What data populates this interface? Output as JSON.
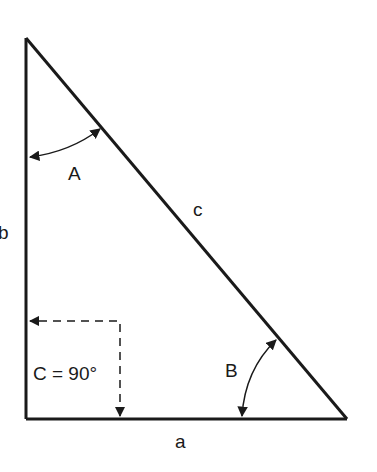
{
  "diagram": {
    "type": "right-triangle",
    "labels": {
      "angle_a": "A",
      "angle_b": "B",
      "angle_c": "C = 90°",
      "side_a": "a",
      "side_b": "b",
      "side_c": "c"
    },
    "colors": {
      "stroke": "#1a1a1a",
      "background": "#ffffff"
    }
  }
}
